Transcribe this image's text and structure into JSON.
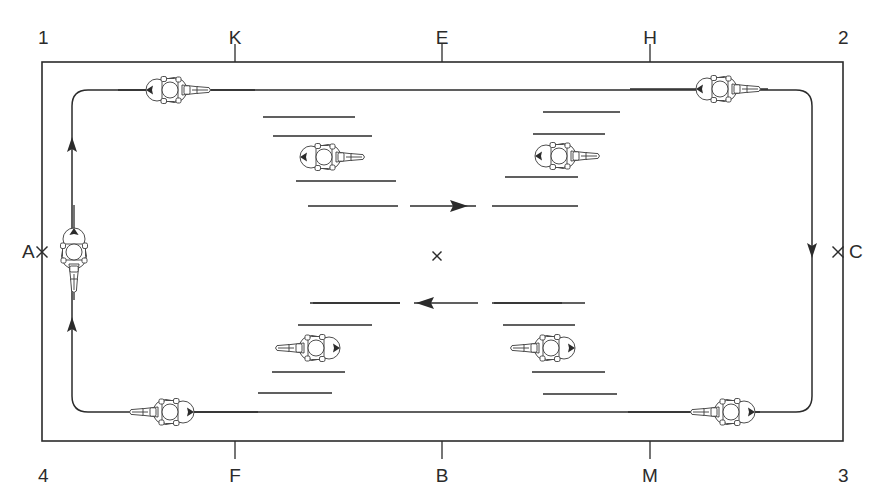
{
  "diagram": {
    "type": "dressage-arena-figure",
    "arena": {
      "left": 42,
      "top": 62,
      "right": 843,
      "bottom": 441,
      "stroke": "#2b2b2b",
      "stroke_width": 1.6
    },
    "corner_labels": [
      {
        "name": "corner-1",
        "text": "1",
        "x": 38,
        "y": 28,
        "anchor": "start"
      },
      {
        "name": "corner-2",
        "text": "2",
        "x": 838,
        "y": 28,
        "anchor": "start"
      },
      {
        "name": "corner-3",
        "text": "3",
        "x": 838,
        "y": 466,
        "anchor": "start"
      },
      {
        "name": "corner-4",
        "text": "4",
        "x": 38,
        "y": 466,
        "anchor": "start"
      }
    ],
    "letter_markers": [
      {
        "name": "marker-K",
        "text": "K",
        "x": 235,
        "y": 28,
        "side": "top",
        "tick_from": 44,
        "tick_to": 62
      },
      {
        "name": "marker-E",
        "text": "E",
        "x": 442,
        "y": 28,
        "side": "top",
        "tick_from": 44,
        "tick_to": 62
      },
      {
        "name": "marker-H",
        "text": "H",
        "x": 650,
        "y": 28,
        "side": "top",
        "tick_from": 44,
        "tick_to": 62
      },
      {
        "name": "marker-F",
        "text": "F",
        "x": 235,
        "y": 466,
        "side": "bottom",
        "tick_from": 441,
        "tick_to": 459
      },
      {
        "name": "marker-B",
        "text": "B",
        "x": 442,
        "y": 466,
        "side": "bottom",
        "tick_from": 441,
        "tick_to": 459
      },
      {
        "name": "marker-M",
        "text": "M",
        "x": 650,
        "y": 466,
        "side": "bottom",
        "tick_from": 441,
        "tick_to": 459
      },
      {
        "name": "marker-A",
        "text": "A",
        "x": 22,
        "y": 252,
        "side": "left",
        "cross_x": 42,
        "cross_y": 252
      },
      {
        "name": "marker-C",
        "text": "C",
        "x": 849,
        "y": 252,
        "side": "right",
        "cross_x": 838,
        "cross_y": 252
      }
    ],
    "center_marker": {
      "name": "center-point-X",
      "x": 437,
      "y": 256,
      "size": 9
    },
    "track": {
      "stroke": "#2b2b2b",
      "stroke_width": 1.5,
      "left_lane_x": 72,
      "right_lane_x": 812,
      "top_lane_y": 90,
      "bottom_lane_y": 412,
      "corner_radius": 16,
      "direction_arrows": [
        {
          "name": "track-arrow-left-upper",
          "x": 72,
          "y": 150,
          "dir": "up"
        },
        {
          "name": "track-arrow-left-lower",
          "x": 72,
          "y": 330,
          "dir": "up"
        },
        {
          "name": "track-arrow-right",
          "x": 812,
          "y": 245,
          "dir": "down"
        }
      ]
    },
    "center_lines": [
      {
        "name": "center-line-upper",
        "y": 206,
        "segments": [
          [
            308,
            398
          ],
          [
            410,
            476
          ],
          [
            492,
            578
          ]
        ],
        "arrow": {
          "x": 452,
          "dir": "right"
        }
      },
      {
        "name": "center-line-lower",
        "y": 303,
        "segments": [
          [
            310,
            400
          ],
          [
            414,
            478
          ],
          [
            494,
            585
          ]
        ],
        "arrow": {
          "x": 432,
          "dir": "left"
        }
      }
    ],
    "dash_marks": [
      {
        "name": "dash-ul-1",
        "x1": 263,
        "y1": 117,
        "x2": 355,
        "y2": 117
      },
      {
        "name": "dash-ul-2",
        "x1": 273,
        "y1": 136,
        "x2": 372,
        "y2": 136
      },
      {
        "name": "dash-ul-3",
        "x1": 296,
        "y1": 181,
        "x2": 396,
        "y2": 181
      },
      {
        "name": "dash-ur-1",
        "x1": 543,
        "y1": 112,
        "x2": 620,
        "y2": 112
      },
      {
        "name": "dash-ur-2",
        "x1": 533,
        "y1": 134,
        "x2": 605,
        "y2": 134
      },
      {
        "name": "dash-ur-3",
        "x1": 505,
        "y1": 177,
        "x2": 578,
        "y2": 177
      },
      {
        "name": "dash-ll-1",
        "x1": 313,
        "y1": 303,
        "x2": 400,
        "y2": 303
      },
      {
        "name": "dash-ll-2",
        "x1": 298,
        "y1": 325,
        "x2": 372,
        "y2": 325
      },
      {
        "name": "dash-ll-3",
        "x1": 272,
        "y1": 372,
        "x2": 345,
        "y2": 372
      },
      {
        "name": "dash-ll-4",
        "x1": 258,
        "y1": 393,
        "x2": 332,
        "y2": 393
      },
      {
        "name": "dash-lr-1",
        "x1": 492,
        "y1": 303,
        "x2": 562,
        "y2": 303
      },
      {
        "name": "dash-lr-2",
        "x1": 503,
        "y1": 325,
        "x2": 575,
        "y2": 325
      },
      {
        "name": "dash-lr-3",
        "x1": 532,
        "y1": 372,
        "x2": 605,
        "y2": 372
      },
      {
        "name": "dash-lr-4",
        "x1": 543,
        "y1": 394,
        "x2": 617,
        "y2": 394
      }
    ],
    "riders": [
      {
        "name": "rider-top-left",
        "x": 168,
        "y": 90,
        "rotation": 0,
        "lead_from": 118,
        "lead_to": 255,
        "lead_axis": "h"
      },
      {
        "name": "rider-top-right",
        "x": 718,
        "y": 89,
        "rotation": 0,
        "lead_from": 630,
        "lead_to": 768,
        "lead_axis": "h"
      },
      {
        "name": "rider-left-center",
        "x": 74,
        "y": 250,
        "rotation": 90,
        "lead_from": 205,
        "lead_to": 300,
        "lead_axis": "v"
      },
      {
        "name": "rider-inner-upper-left",
        "x": 322,
        "y": 157,
        "rotation": 0,
        "lead_from": 0,
        "lead_to": 0,
        "lead_axis": "none"
      },
      {
        "name": "rider-inner-upper-right",
        "x": 557,
        "y": 156,
        "rotation": 0,
        "lead_from": 0,
        "lead_to": 0,
        "lead_axis": "none"
      },
      {
        "name": "rider-inner-lower-left",
        "x": 318,
        "y": 348,
        "rotation": 180,
        "lead_from": 0,
        "lead_to": 0,
        "lead_axis": "none"
      },
      {
        "name": "rider-inner-lower-right",
        "x": 553,
        "y": 348,
        "rotation": 180,
        "lead_from": 0,
        "lead_to": 0,
        "lead_axis": "none"
      },
      {
        "name": "rider-bottom-left",
        "x": 172,
        "y": 412,
        "rotation": 180,
        "lead_from": 135,
        "lead_to": 258,
        "lead_axis": "h"
      },
      {
        "name": "rider-bottom-right",
        "x": 733,
        "y": 412,
        "rotation": 180,
        "lead_from": 628,
        "lead_to": 760,
        "lead_axis": "h"
      }
    ]
  }
}
